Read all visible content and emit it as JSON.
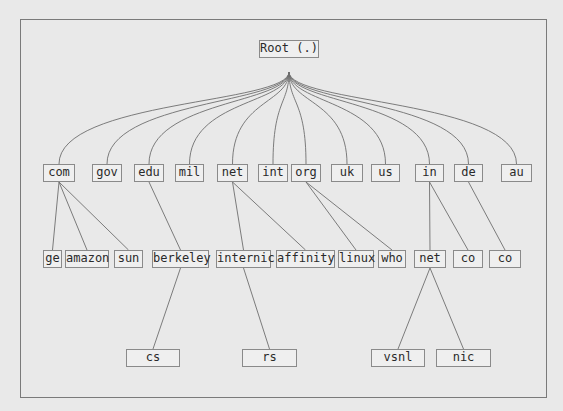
{
  "diagram": {
    "root": {
      "label": "Root (.)",
      "x": 259,
      "y": 40,
      "w": 60,
      "h": 18
    },
    "fan_origin": {
      "x": 289,
      "y": 72
    },
    "tlds": [
      {
        "id": "com",
        "label": "com",
        "x": 43,
        "y": 164,
        "w": 32,
        "h": 18
      },
      {
        "id": "gov",
        "label": "gov",
        "x": 92,
        "y": 164,
        "w": 30,
        "h": 18
      },
      {
        "id": "edu",
        "label": "edu",
        "x": 134,
        "y": 164,
        "w": 30,
        "h": 18
      },
      {
        "id": "mil",
        "label": "mil",
        "x": 175,
        "y": 164,
        "w": 29,
        "h": 18
      },
      {
        "id": "net",
        "label": "net",
        "x": 217,
        "y": 164,
        "w": 31,
        "h": 18
      },
      {
        "id": "int",
        "label": "int",
        "x": 258,
        "y": 164,
        "w": 30,
        "h": 18
      },
      {
        "id": "org",
        "label": "org",
        "x": 291,
        "y": 164,
        "w": 30,
        "h": 18
      },
      {
        "id": "uk",
        "label": "uk",
        "x": 331,
        "y": 164,
        "w": 32,
        "h": 18
      },
      {
        "id": "us",
        "label": "us",
        "x": 371,
        "y": 164,
        "w": 29,
        "h": 18
      },
      {
        "id": "in",
        "label": "in",
        "x": 415,
        "y": 164,
        "w": 29,
        "h": 18
      },
      {
        "id": "de",
        "label": "de",
        "x": 454,
        "y": 164,
        "w": 29,
        "h": 18
      },
      {
        "id": "au",
        "label": "au",
        "x": 501,
        "y": 164,
        "w": 31,
        "h": 18
      }
    ],
    "second_level": [
      {
        "id": "ge",
        "label": "ge",
        "parent": "com",
        "x": 43,
        "y": 250,
        "w": 19,
        "h": 18
      },
      {
        "id": "amazon",
        "label": "amazon",
        "parent": "com",
        "x": 65,
        "y": 250,
        "w": 44,
        "h": 18
      },
      {
        "id": "sun",
        "label": "sun",
        "parent": "com",
        "x": 114,
        "y": 250,
        "w": 29,
        "h": 18
      },
      {
        "id": "berkeley",
        "label": "berkeley",
        "parent": "edu",
        "x": 152,
        "y": 250,
        "w": 57,
        "h": 18
      },
      {
        "id": "internic",
        "label": "internic",
        "parent": "net",
        "x": 216,
        "y": 250,
        "w": 55,
        "h": 18
      },
      {
        "id": "affinity",
        "label": "affinity",
        "parent": "net",
        "x": 276,
        "y": 250,
        "w": 59,
        "h": 18
      },
      {
        "id": "linux",
        "label": "linux",
        "parent": "org",
        "x": 338,
        "y": 250,
        "w": 36,
        "h": 18
      },
      {
        "id": "who",
        "label": "who",
        "parent": "org",
        "x": 378,
        "y": 250,
        "w": 28,
        "h": 18
      },
      {
        "id": "in-net",
        "label": "net",
        "parent": "in",
        "x": 414,
        "y": 250,
        "w": 32,
        "h": 18
      },
      {
        "id": "in-co",
        "label": "co",
        "parent": "in",
        "x": 453,
        "y": 250,
        "w": 30,
        "h": 18
      },
      {
        "id": "de-co",
        "label": "co",
        "parent": "de",
        "x": 489,
        "y": 250,
        "w": 32,
        "h": 18
      }
    ],
    "third_level": [
      {
        "id": "cs",
        "label": "cs",
        "parent": "berkeley",
        "x": 126,
        "y": 349,
        "w": 54,
        "h": 18
      },
      {
        "id": "rs",
        "label": "rs",
        "parent": "internic",
        "x": 242,
        "y": 349,
        "w": 55,
        "h": 18
      },
      {
        "id": "vsnl",
        "label": "vsnl",
        "parent": "in-net",
        "x": 371,
        "y": 349,
        "w": 54,
        "h": 18
      },
      {
        "id": "nic",
        "label": "nic",
        "parent": "in-net",
        "x": 436,
        "y": 349,
        "w": 55,
        "h": 18
      }
    ]
  },
  "colors": {
    "background": "#e9e9e9",
    "line": "#6e6e6e",
    "box_border": "#8a8a8a",
    "box_fill": "#efefef",
    "text": "#2a2a2a"
  }
}
